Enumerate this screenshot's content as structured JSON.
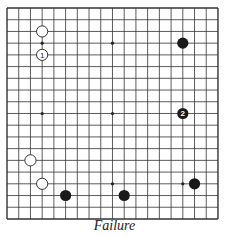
{
  "board": {
    "size": 19,
    "origin_x": 7,
    "origin_y": 8,
    "spacing": 11.72,
    "line_color": "#333333",
    "star_points": [
      [
        3,
        3
      ],
      [
        3,
        9
      ],
      [
        3,
        15
      ],
      [
        9,
        3
      ],
      [
        9,
        9
      ],
      [
        9,
        15
      ],
      [
        15,
        3
      ],
      [
        15,
        9
      ],
      [
        15,
        15
      ]
    ],
    "stones": [
      {
        "col": 3,
        "row": 2,
        "color": "white",
        "label": ""
      },
      {
        "col": 3,
        "row": 4,
        "color": "white",
        "label": "1"
      },
      {
        "col": 15,
        "row": 3,
        "color": "black",
        "label": ""
      },
      {
        "col": 15,
        "row": 9,
        "color": "black",
        "label": "2"
      },
      {
        "col": 2,
        "row": 13,
        "color": "white",
        "label": ""
      },
      {
        "col": 3,
        "row": 15,
        "color": "white",
        "label": ""
      },
      {
        "col": 5,
        "row": 16,
        "color": "black",
        "label": ""
      },
      {
        "col": 10,
        "row": 16,
        "color": "black",
        "label": ""
      },
      {
        "col": 16,
        "row": 15,
        "color": "black",
        "label": ""
      }
    ]
  },
  "caption": "Failure"
}
